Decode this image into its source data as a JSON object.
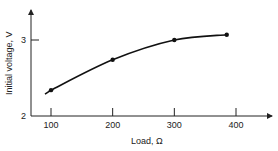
{
  "chart_data": {
    "type": "line",
    "title": "",
    "xlabel": "Load, Ω",
    "ylabel": "Initial voltage, V",
    "x_ticks": [
      100,
      200,
      300,
      400
    ],
    "y_ticks": [
      2,
      3
    ],
    "xlim": [
      70,
      430
    ],
    "ylim": [
      2,
      3.4
    ],
    "grid": false,
    "legend": null,
    "series": [
      {
        "name": "Initial voltage",
        "x": [
          100,
          200,
          300,
          385
        ],
        "y": [
          2.34,
          2.74,
          3.0,
          3.07
        ]
      }
    ],
    "colors": {
      "line": "#111111",
      "axis": "#222222"
    }
  }
}
